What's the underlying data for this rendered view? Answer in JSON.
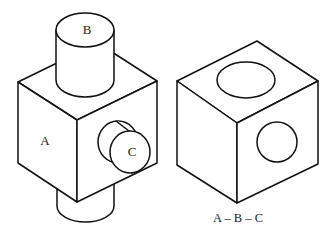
{
  "figure": {
    "left_object": {
      "description": "Cube with cylinders attached on top, bottom and right face",
      "labels": {
        "front_face": "A",
        "top_cylinder": "B",
        "side_cylinder": "C"
      }
    },
    "right_object": {
      "description": "Cube with circular holes on top and right face",
      "caption": "A – B – C"
    },
    "colors": {
      "stroke": "#111111",
      "background": "#ffffff"
    }
  }
}
